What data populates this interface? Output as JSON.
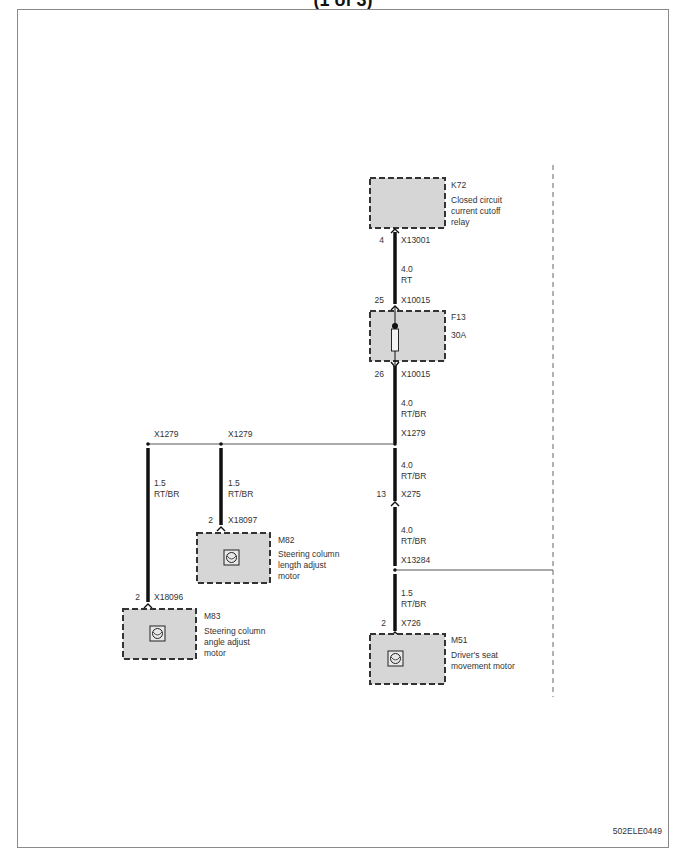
{
  "title_fragment": "(1 of 3)",
  "reference_code": "502ELE0449",
  "colors": {
    "component_fill": "#d6d6d6",
    "wire": "#111111",
    "frame": "#8a8a8a",
    "dash": "#444444"
  },
  "components": [
    {
      "id": "K72",
      "desc": [
        "Closed circuit",
        "current cutoff",
        "relay"
      ]
    },
    {
      "id": "F13",
      "desc": [
        "30A"
      ]
    },
    {
      "id": "M82",
      "desc": [
        "Steering column",
        "length adjust",
        "motor"
      ]
    },
    {
      "id": "M83",
      "desc": [
        "Steering column",
        "angle adjust",
        "motor"
      ]
    },
    {
      "id": "M51",
      "desc": [
        "Driver's seat",
        "movement motor"
      ]
    }
  ],
  "connectors": {
    "k72_pin": "4",
    "k72_conn": "X13001",
    "f13_in_pin": "25",
    "f13_in_conn": "X10015",
    "f13_out_pin": "26",
    "f13_out_conn": "X10015",
    "splice_main": "X1279",
    "splice_left1": "X1279",
    "splice_left2": "X1279",
    "x275_pin": "13",
    "x275_conn": "X275",
    "splice_x13284": "X13284",
    "m51_pin": "2",
    "m51_conn": "X726",
    "m82_pin": "2",
    "m82_conn": "X18097",
    "m83_pin": "2",
    "m83_conn": "X18096"
  },
  "wires": [
    {
      "size": "4.0",
      "color": "RT"
    },
    {
      "size": "4.0",
      "color": "RT/BR"
    },
    {
      "size": "4.0",
      "color": "RT/BR"
    },
    {
      "size": "4.0",
      "color": "RT/BR"
    },
    {
      "size": "1.5",
      "color": "RT/BR"
    },
    {
      "size": "1.5",
      "color": "RT/BR"
    },
    {
      "size": "1.5",
      "color": "RT/BR"
    }
  ]
}
